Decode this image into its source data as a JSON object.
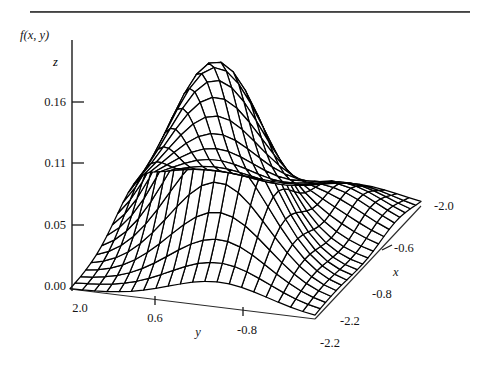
{
  "figure": {
    "kind": "3d-wireframe-surface-plot",
    "background": "#ffffff",
    "ink": "#000000",
    "top_rule": true
  },
  "axes": {
    "z": {
      "title": "f(x, y)",
      "name": "z",
      "tick_labels": [
        "0.16",
        "0.11",
        "0.05",
        "0.00"
      ],
      "tick_values": [
        0.16,
        0.11,
        0.05,
        0.0
      ],
      "range": [
        0.0,
        0.19
      ]
    },
    "y": {
      "name": "y",
      "tick_labels": [
        "2.0",
        "0.6",
        "-0.8",
        "-2.2"
      ],
      "tick_values": [
        2.0,
        0.6,
        -0.8,
        -2.2
      ],
      "range": [
        -2.2,
        2.0
      ]
    },
    "x": {
      "name": "x",
      "tick_labels": [
        "-2.0",
        "-0.6",
        "-0.8",
        "-2.2"
      ],
      "tick_values": [
        -2.0,
        -0.6,
        -0.8,
        -2.2
      ],
      "range": [
        -2.2,
        2.0
      ]
    }
  },
  "chart_data": {
    "type": "surface",
    "title": "",
    "subtitle": "",
    "xlabel": "x",
    "ylabel": "y",
    "zlabel": "f(x, y)",
    "z_axis_title": "f(x, y)",
    "z_axis_name": "z",
    "grid": false,
    "legend": "none",
    "xlim": [
      -2.2,
      2.0
    ],
    "ylim": [
      -2.2,
      2.0
    ],
    "zlim": [
      0.0,
      0.19
    ],
    "x_tick_labels": [
      "-2.0",
      "-0.6",
      "-0.8",
      "-2.2"
    ],
    "y_tick_labels": [
      "2.0",
      "0.6",
      "-0.8",
      "-2.2"
    ],
    "z_tick_labels": [
      "0.00",
      "0.05",
      "0.11",
      "0.16"
    ],
    "z_tick_values": [
      0.0,
      0.05,
      0.11,
      0.16
    ],
    "peak": {
      "x": -0.35,
      "y": 0.35,
      "z": 0.18
    },
    "mesh_divisions": {
      "nx": 20,
      "ny": 20
    },
    "surface_model": "gaussian-mixture",
    "components": [
      {
        "amplitude": 0.159,
        "mu_x": -0.3,
        "mu_y": 0.3,
        "sigma_x": 0.95,
        "sigma_y": 0.95,
        "rho": 0.45
      },
      {
        "amplitude": 0.03,
        "mu_x": 1.05,
        "mu_y": -1.15,
        "sigma_x": 0.7,
        "sigma_y": 0.7,
        "rho": 0.0
      }
    ]
  }
}
